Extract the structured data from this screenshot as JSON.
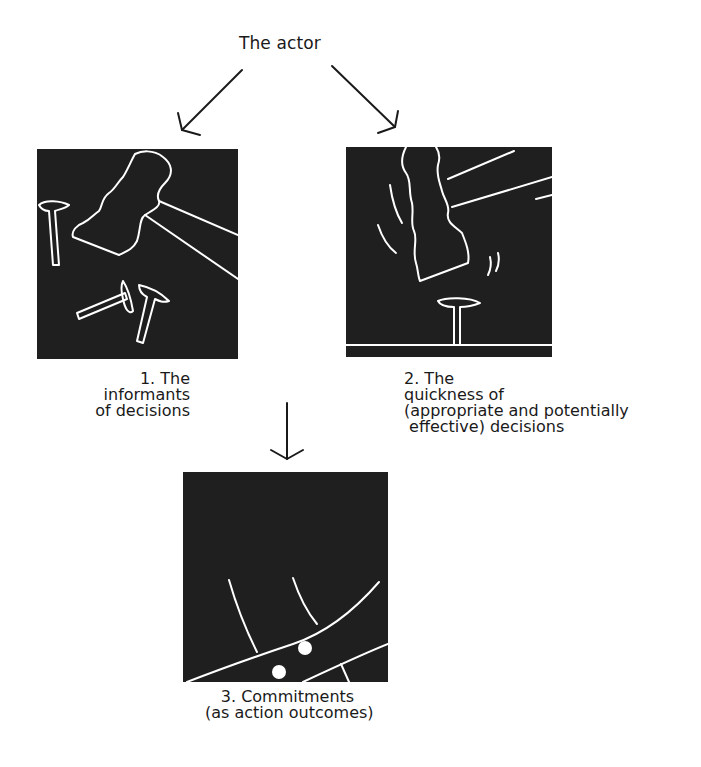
{
  "diagram": {
    "title": "The actor",
    "panels": [
      {
        "id": 1,
        "illustration": "hammer-and-scattered-nails",
        "caption_lines": [
          "1. The",
          "informants",
          "of decisions"
        ]
      },
      {
        "id": 2,
        "illustration": "hammer-striking-nail",
        "caption_lines": [
          "2. The",
          "quickness of",
          "(appropriate and potentially",
          " effective) decisions"
        ]
      },
      {
        "id": 3,
        "illustration": "nail-driven-in-surface",
        "caption_lines": [
          "3. Commitments",
          "(as action outcomes)"
        ]
      }
    ],
    "arrows": [
      {
        "from": "title",
        "to": "panel-1",
        "direction": "down-left"
      },
      {
        "from": "title",
        "to": "panel-2",
        "direction": "down-right"
      },
      {
        "from": "panels-1-2",
        "to": "panel-3",
        "direction": "down"
      }
    ],
    "colors": {
      "panel_bg": "#1f1f1f",
      "line": "#ffffff",
      "text": "#1a1a1a",
      "arrow": "#1a1a1a"
    }
  }
}
